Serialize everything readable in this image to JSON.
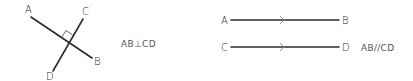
{
  "figures": {
    "perpendicular": {
      "points": {
        "A": "A",
        "B": "B",
        "C": "C",
        "D": "D"
      },
      "statement": "AB⊥CD",
      "right_angle_mark": true
    },
    "parallel": {
      "points": {
        "A": "A",
        "B": "B",
        "C": "C",
        "D": "D"
      },
      "statement": "AB//CD",
      "direction_marks": [
        "chevron-right",
        "chevron-right"
      ]
    }
  },
  "colors": {
    "line": "#2b2b2b",
    "label": "#2b2b2b",
    "statement": "#555555",
    "arrow_mark": "#888888"
  }
}
